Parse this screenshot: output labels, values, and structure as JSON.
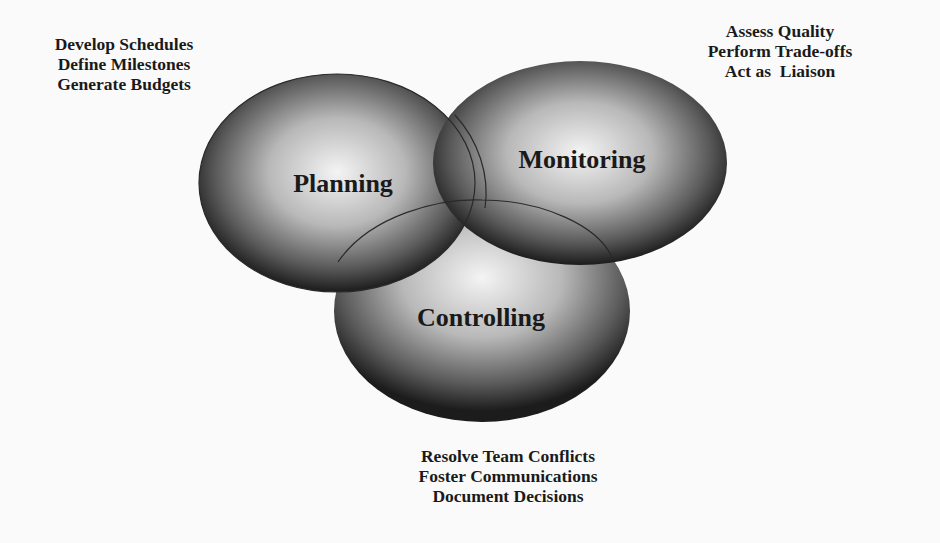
{
  "diagram": {
    "circles": [
      {
        "id": "planning",
        "label": "Planning",
        "notes": [
          "Develop Schedules",
          "Define Milestones",
          "Generate Budgets"
        ]
      },
      {
        "id": "monitoring",
        "label": "Monitoring",
        "notes": [
          "Assess Quality",
          "Perform Trade-offs",
          "Act as  Liaison"
        ]
      },
      {
        "id": "controlling",
        "label": "Controlling",
        "notes": [
          "Resolve Team Conflicts",
          "Foster Communications",
          "Document Decisions"
        ]
      }
    ]
  }
}
